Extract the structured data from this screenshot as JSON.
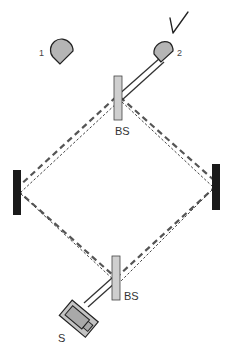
{
  "diagram": {
    "type": "Mach-Zehnder interferometer",
    "labels": {
      "detector_1": "1",
      "detector_2": "2",
      "beam_splitter_top": "BS",
      "beam_splitter_bottom": "BS",
      "source": "S"
    },
    "annotation": "checkmark",
    "components": [
      "source",
      "beam-splitter-bottom",
      "mirror-left",
      "mirror-right",
      "beam-splitter-top",
      "detector-1",
      "detector-2"
    ],
    "colors": {
      "mirror": "#1a1a1a",
      "beam_splitter_fill": "#cfcfcf",
      "detector_fill": "#b5b5b5",
      "beam_dash": "#555555",
      "outline": "#333333"
    }
  }
}
